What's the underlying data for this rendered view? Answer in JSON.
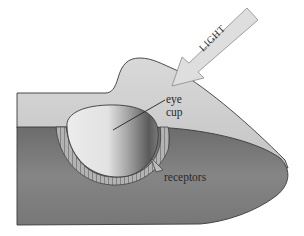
{
  "figure": {
    "labels": {
      "light": "LIGHT",
      "eye_line1": "eye",
      "eye_line2": "cup",
      "receptors": "receptors"
    },
    "colors": {
      "background": "#ffffff",
      "top_surface": "#cfcfcf",
      "front_face": "#7d7d7d",
      "cup_light": "#e6e6e6",
      "cup_dark": "#6e6e6e",
      "receptor_band": "#a9a9a9",
      "outline": "#3a3a3a",
      "arrow_fill": "#dedede"
    }
  }
}
